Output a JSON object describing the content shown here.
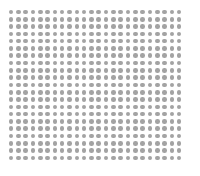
{
  "canvas": {
    "width": 200,
    "height": 176,
    "background_color": "#ffffff",
    "label": "dot grid pattern"
  },
  "chart_data": {
    "type": "scatter",
    "title": "",
    "subtitle": "",
    "xlabel": "",
    "ylabel": "",
    "legend": [],
    "annotations": [],
    "grid": false,
    "axes_visible": false,
    "tick_labels_x": [],
    "tick_labels_y": [],
    "marker": {
      "shape": "circle",
      "color": "#a3a3a3",
      "diameter_px": 4.6,
      "opacity": 1
    },
    "layout": {
      "columns": 24,
      "rows": 21,
      "total_points": 504,
      "origin_x_px": 11,
      "origin_y_px": 12,
      "pitch_x_px": 7.32,
      "pitch_y_px": 7.3,
      "extent_x_px": [
        11,
        186
      ],
      "extent_y_px": [
        12,
        164
      ]
    },
    "xlim": [
      0,
      23
    ],
    "ylim": [
      0,
      20
    ]
  }
}
